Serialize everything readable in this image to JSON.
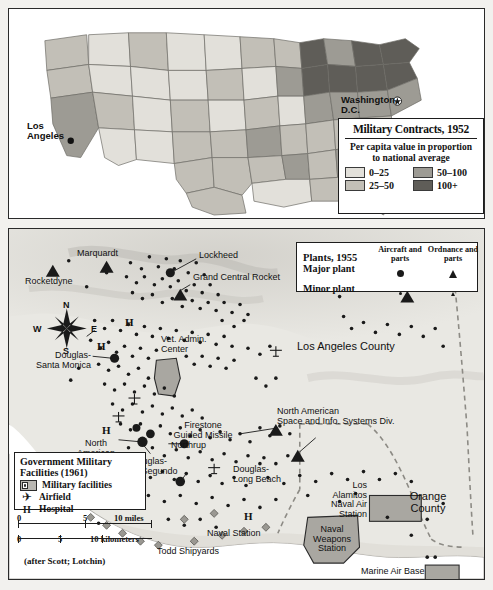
{
  "figure": {
    "panels": [
      "national-contracts-map",
      "los-angeles-defense-map"
    ]
  },
  "top_map": {
    "name": "United States military contracts choropleth",
    "city_labels": [
      {
        "name": "Washington, D.C.",
        "text": "Washington,\nD.C."
      },
      {
        "name": "Los Angeles",
        "text": "Los\nAngeles"
      }
    ],
    "legend": {
      "title": "Military Contracts, 1952",
      "subtitle": "Per capita value\nin proportion\nto national average",
      "classes": [
        {
          "label": "0–25",
          "color": "#e2e0da"
        },
        {
          "label": "50–100",
          "color": "#9d9b94"
        },
        {
          "label": "25–50",
          "color": "#c2bfb7"
        },
        {
          "label": "100+",
          "color": "#5f5d58"
        }
      ]
    }
  },
  "bottom_map": {
    "name": "Los Angeles and Orange County defense industry",
    "plants_legend": {
      "title": "Plants, 1955",
      "columns": [
        "Aircraft\nand parts",
        "Ordnance\nand parts"
      ],
      "rows": [
        {
          "label": "Major plant",
          "aircraft_symbol": "large-filled-circle",
          "ordnance_symbol": "large-filled-triangle"
        },
        {
          "label": "Minor plant",
          "aircraft_symbol": "small-filled-circle",
          "ordnance_symbol": "small-filled-triangle"
        }
      ]
    },
    "gov_legend": {
      "title": "Government Military\nFacilities (1961)",
      "items": [
        {
          "label": "Military facilities",
          "symbol": "shaded-rectangle-with-inset-box"
        },
        {
          "label": "Airfield",
          "symbol": "airplane-glyph"
        },
        {
          "label": "Hospital",
          "symbol": "letter-H"
        }
      ]
    },
    "scalebars": [
      {
        "unit": "miles",
        "ticks": [
          "0",
          "5",
          "10"
        ],
        "unit_label": "10 miles"
      },
      {
        "unit": "kilometers",
        "ticks": [
          "0",
          "5",
          "10"
        ],
        "unit_label": "10 kilometers"
      }
    ],
    "credit": "(after Scott; Lotchin)",
    "compass": {
      "north": "N",
      "east": "E",
      "south": "S",
      "west": "W"
    },
    "area_labels": [
      {
        "name": "los-angeles-county",
        "text": "Los Angeles County"
      },
      {
        "name": "orange-county",
        "text": "Orange\nCounty"
      }
    ],
    "plant_labels": [
      {
        "name": "marquardt",
        "text": "Marquardt"
      },
      {
        "name": "rocketdyne",
        "text": "Rocketdyne"
      },
      {
        "name": "lockheed",
        "text": "Lockheed"
      },
      {
        "name": "grand-central-rocket",
        "text": "Grand Central Rocket"
      },
      {
        "name": "aerojet",
        "text": "Aerojet"
      },
      {
        "name": "general-dynamics-pomona",
        "text": "General Dynamics-\nPomona"
      },
      {
        "name": "vet-admin-center",
        "text": "Vet. Admin.\nCenter"
      },
      {
        "name": "douglas-santa-monica",
        "text": "Douglas-\nSanta Monica"
      },
      {
        "name": "north-american",
        "text": "North\nAmerican"
      },
      {
        "name": "firestone-guided-missile",
        "text": "Firestone\nGuided Missile"
      },
      {
        "name": "northrup",
        "text": "Northrup"
      },
      {
        "name": "douglas-el-segundo",
        "text": "Douglas-\nEl Segundo"
      },
      {
        "name": "north-american-space-info",
        "text": "North American\nSpace and Info. Systems Div."
      },
      {
        "name": "douglas-long-beach",
        "text": "Douglas-\nLong Beach"
      },
      {
        "name": "los-alamitos-naval-air-station",
        "text": "Los\nAlamitos\nNaval Air\nStation"
      },
      {
        "name": "naval-weapons-station",
        "text": "Naval\nWeapons\nStation"
      },
      {
        "name": "naval-station",
        "text": "Naval Station"
      },
      {
        "name": "todd-shipyards",
        "text": "Todd Shipyards"
      },
      {
        "name": "marine-air-base",
        "text": "Marine Air Base"
      }
    ]
  },
  "colors": {
    "ink": "#1a1a1a",
    "land_light": "#e2e0da",
    "land_mid": "#c2bfb7",
    "land_dark": "#9d9b94",
    "land_darkest": "#5f5d58",
    "water": "#ffffff",
    "facility_fill": "#b9b7b2"
  }
}
